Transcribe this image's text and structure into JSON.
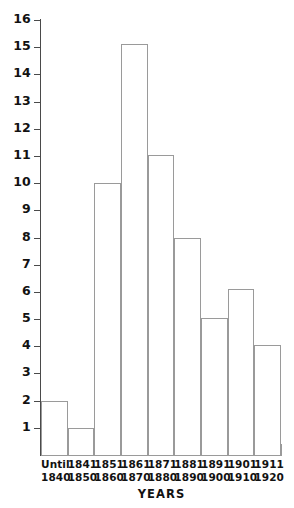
{
  "chart_data": {
    "type": "bar",
    "title": "",
    "subtitle": "",
    "xlabel": "YEARS",
    "ylabel": "",
    "ylim": [
      0,
      16
    ],
    "xlim_categories": 9,
    "grid": false,
    "legend": null,
    "bar_style": "outlined",
    "categories": [
      "Until 1840",
      "1841 1850",
      "1851 1860",
      "1861 1870",
      "1871 1880",
      "1881 1890",
      "1891 1900",
      "1901 1910",
      "1911 1920"
    ],
    "category_lines": [
      [
        "Until",
        "1840"
      ],
      [
        "1841",
        "1850"
      ],
      [
        "1851",
        "1860"
      ],
      [
        "1861",
        "1870"
      ],
      [
        "1871",
        "1880"
      ],
      [
        "1881",
        "1890"
      ],
      [
        "1891",
        "1900"
      ],
      [
        "1901",
        "1910"
      ],
      [
        "1911",
        "1920"
      ]
    ],
    "values": [
      2,
      1,
      10,
      15.1,
      11.05,
      8,
      5.05,
      6.1,
      4.05
    ],
    "y_ticks": [
      1,
      2,
      3,
      4,
      5,
      6,
      7,
      8,
      9,
      10,
      11,
      12,
      13,
      14,
      15,
      16
    ],
    "y_tick_labels": [
      "1",
      "2",
      "3",
      "4",
      "5",
      "6",
      "7",
      "8",
      "9",
      "10",
      "11",
      "12",
      "13",
      "14",
      "15",
      "16"
    ],
    "colors": {
      "background": "#ffffff",
      "axis": "#4a4a4a",
      "bar_outline": "#9a9a9a",
      "text": "#121212"
    }
  }
}
